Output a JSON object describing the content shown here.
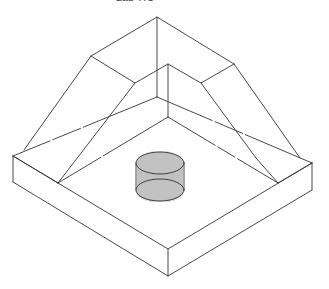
{
  "header": {
    "title": "Lab 7.C"
  },
  "drawing": {
    "description": "Isometric wireframe of a square base slab with a hollow pyramidal frustum hood on top and a vertical cylinder in the center",
    "stroke_color": "#333333",
    "background": "#ffffff"
  }
}
